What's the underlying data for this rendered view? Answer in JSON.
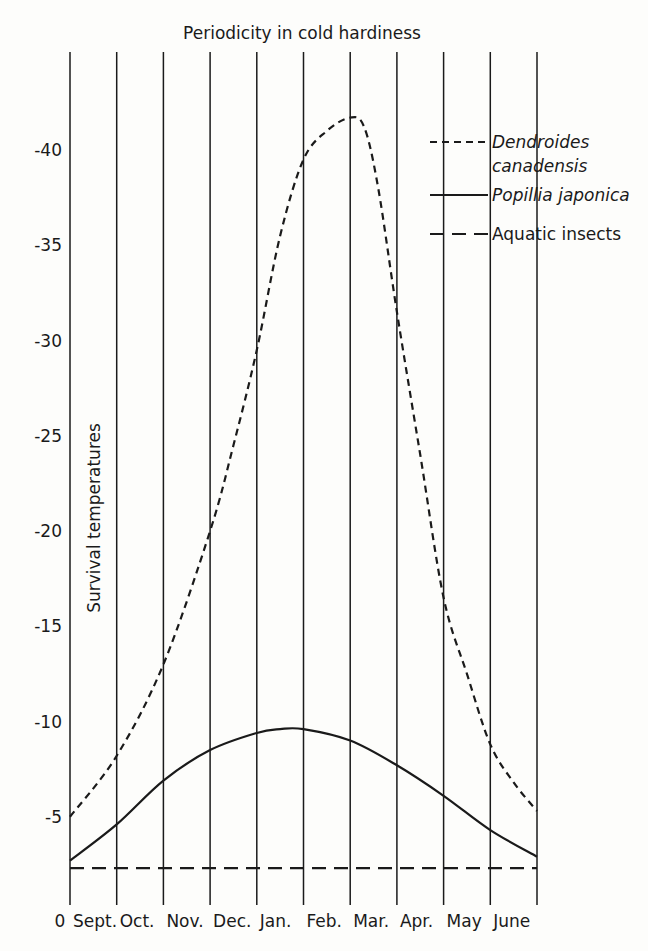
{
  "chart_data": {
    "type": "line",
    "title": "Periodicity in cold hardiness",
    "xlabel": "",
    "ylabel": "Survival temperatures",
    "categories": [
      "Sept.",
      "Oct.",
      "Nov.",
      "Dec.",
      "Jan.",
      "Feb.",
      "Mar.",
      "Apr.",
      "May",
      "June"
    ],
    "origin_label": "0",
    "yticks": [
      -5,
      -10,
      -15,
      -20,
      -25,
      -30,
      -35,
      -40
    ],
    "ytick_labels": [
      "-5",
      "-10",
      "-15",
      "-20",
      "-25",
      "-30",
      "-35",
      "-40"
    ],
    "ylim": [
      0,
      -43
    ],
    "grid": "vertical month dividers",
    "legend_position": "top-right",
    "x_months": [
      0,
      1,
      2,
      3,
      4,
      5,
      6,
      7,
      8,
      9,
      10
    ],
    "series": [
      {
        "name": "Dendroides canadensis",
        "name_lines": [
          "Dendroides",
          "canadensis"
        ],
        "style": "dashed-short",
        "italic": true,
        "x": [
          0,
          1,
          2,
          3,
          3.5,
          4,
          4.5,
          5,
          5.5,
          6,
          6.3,
          6.6,
          7,
          7.5,
          8,
          8.5,
          9,
          9.5,
          10
        ],
        "values": [
          -5,
          -8.2,
          -13,
          -20,
          -24.5,
          -29.5,
          -35.5,
          -39.5,
          -41,
          -41.7,
          -41.2,
          -38,
          -31.5,
          -24,
          -16.5,
          -12.5,
          -8.8,
          -6.8,
          -5.3
        ]
      },
      {
        "name": "Popillia japonica",
        "name_lines": [
          "Popillia japonica"
        ],
        "style": "solid",
        "italic": true,
        "x": [
          0,
          1,
          2,
          3,
          4,
          4.5,
          5,
          6,
          7,
          8,
          9,
          10
        ],
        "values": [
          -2.7,
          -4.6,
          -6.9,
          -8.5,
          -9.4,
          -9.6,
          -9.6,
          -9.0,
          -7.7,
          -6.1,
          -4.3,
          -2.9
        ]
      },
      {
        "name": "Aquatic insects",
        "name_lines": [
          "Aquatic insects"
        ],
        "style": "dashed-long",
        "italic": false,
        "x": [
          0,
          10
        ],
        "values": [
          -2.3,
          -2.3
        ]
      }
    ]
  }
}
